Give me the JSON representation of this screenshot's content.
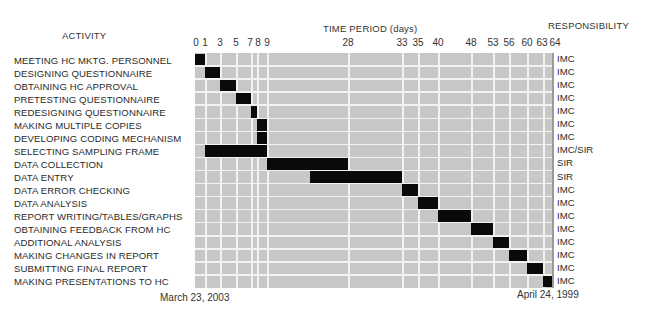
{
  "headers": {
    "activity": "ACTIVITY",
    "time_period": "TIME PERIOD (days)",
    "responsibility": "RESPONSIBILITY"
  },
  "dates": {
    "start": "March 23, 2003",
    "end": "April 24, 1999"
  },
  "colors": {
    "bar": "#0a0a0a",
    "background": "#c7c7c7",
    "grid": "#f2f2f2"
  },
  "chart_data": {
    "type": "gantt",
    "title": "",
    "xlabel": "TIME PERIOD (days)",
    "ylabel": "ACTIVITY",
    "x_ticks": [
      0,
      1,
      3,
      5,
      7,
      8,
      9,
      28,
      33,
      35,
      40,
      48,
      53,
      56,
      60,
      63,
      64
    ],
    "x_tick_px": [
      0,
      10,
      25,
      41,
      56,
      62,
      72,
      153,
      207,
      223,
      243,
      276,
      298,
      314,
      332,
      348,
      357
    ],
    "xlim": [
      0,
      64
    ],
    "grid": true,
    "annotations": [
      "March 23, 2003",
      "April 24, 1999"
    ],
    "tasks": [
      {
        "activity": "MEETING HC MKTG. PERSONNEL",
        "start": 0,
        "end": 1,
        "responsibility": "IMC"
      },
      {
        "activity": "DESIGNING QUESTIONNAIRE",
        "start": 1,
        "end": 3,
        "responsibility": "IMC"
      },
      {
        "activity": "OBTAINING HC APPROVAL",
        "start": 3,
        "end": 5,
        "responsibility": "IMC"
      },
      {
        "activity": "PRETESTING QUESTIONNAIRE",
        "start": 5,
        "end": 7,
        "responsibility": "IMC"
      },
      {
        "activity": "REDESIGNING QUESTIONNAIRE",
        "start": 7,
        "end": 8,
        "responsibility": "IMC"
      },
      {
        "activity": "MAKING MULTIPLE COPIES",
        "start": 8,
        "end": 9,
        "responsibility": "IMC"
      },
      {
        "activity": "DEVELOPING CODING MECHANISM",
        "start": 8,
        "end": 9,
        "responsibility": "IMC"
      },
      {
        "activity": "SELECTING SAMPLING FRAME",
        "start": 1,
        "end": 9,
        "responsibility": "IMC/SIR"
      },
      {
        "activity": "DATA COLLECTION",
        "start": 9,
        "end": 28,
        "responsibility": "SIR"
      },
      {
        "activity": "DATA ENTRY",
        "start": 19,
        "end": 33,
        "responsibility": "SIR"
      },
      {
        "activity": "DATA ERROR CHECKING",
        "start": 33,
        "end": 35,
        "responsibility": "IMC"
      },
      {
        "activity": "DATA ANALYSIS",
        "start": 35,
        "end": 40,
        "responsibility": "IMC"
      },
      {
        "activity": "REPORT WRITING/TABLES/GRAPHS",
        "start": 40,
        "end": 48,
        "responsibility": "IMC"
      },
      {
        "activity": "OBTAINING FEEDBACK FROM HC",
        "start": 48,
        "end": 53,
        "responsibility": "IMC"
      },
      {
        "activity": "ADDITIONAL ANALYSIS",
        "start": 53,
        "end": 56,
        "responsibility": "IMC"
      },
      {
        "activity": "MAKING CHANGES IN REPORT",
        "start": 56,
        "end": 60,
        "responsibility": "IMC"
      },
      {
        "activity": "SUBMITTING FINAL REPORT",
        "start": 60,
        "end": 63,
        "responsibility": "IMC"
      },
      {
        "activity": "MAKING PRESENTATIONS TO HC",
        "start": 63,
        "end": 64,
        "responsibility": "IMC"
      }
    ]
  }
}
